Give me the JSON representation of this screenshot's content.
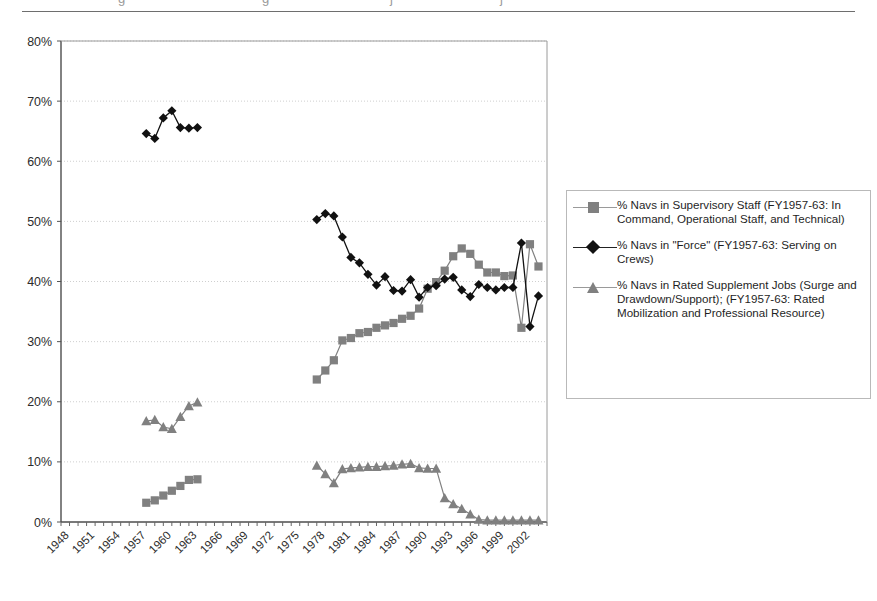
{
  "header": {
    "rule": true,
    "cropped_fragments": [
      "g",
      "g",
      "j",
      "j"
    ]
  },
  "legend": {
    "position": "right",
    "items": [
      {
        "marker": "square",
        "color": "#808080",
        "label": "% Navs in Supervisory Staff (FY1957-63:  In Command, Operational Staff, and Technical)"
      },
      {
        "marker": "diamond",
        "color": "#111111",
        "label": "% Navs in \"Force\" (FY1957-63:  Serving on Crews)"
      },
      {
        "marker": "triangle",
        "color": "#808080",
        "label": "% Navs in Rated Supplement Jobs (Surge and Drawdown/Support); (FY1957-63:  Rated Mobilization and Professional Resource)"
      }
    ]
  },
  "chart_data": {
    "type": "line",
    "title": "",
    "xlabel": "",
    "ylabel": "",
    "ylim": [
      0,
      80
    ],
    "yticks": [
      0,
      10,
      20,
      30,
      40,
      50,
      60,
      70,
      80
    ],
    "ytick_labels": [
      "0%",
      "10%",
      "20%",
      "30%",
      "40%",
      "50%",
      "60%",
      "70%",
      "80%"
    ],
    "xlim": [
      1947,
      2004
    ],
    "xticks": [
      1948,
      1951,
      1954,
      1957,
      1960,
      1963,
      1966,
      1969,
      1972,
      1975,
      1978,
      1981,
      1984,
      1987,
      1990,
      1993,
      1996,
      1999,
      2002
    ],
    "xtick_labels": [
      "1948",
      "1951",
      "1954",
      "1957",
      "1960",
      "1963",
      "1966",
      "1969",
      "1972",
      "1975",
      "1978",
      "1981",
      "1984",
      "1987",
      "1990",
      "1993",
      "1996",
      "1999",
      "2002"
    ],
    "xtick_rotation": 45,
    "minor_xticks_annual": true,
    "grid": "horizontal-dotted",
    "series": [
      {
        "name": "% Navs in Supervisory Staff (FY1957-63:  In Command, Operational Staff, and Technical)",
        "marker": "square",
        "color": "#808080",
        "segments": [
          {
            "x": [
              1957,
              1958,
              1959,
              1960,
              1961,
              1962,
              1963
            ],
            "y": [
              3.2,
              3.6,
              4.4,
              5.2,
              6.0,
              7.0,
              7.1
            ]
          },
          {
            "x": [
              1977,
              1978,
              1979,
              1980,
              1981,
              1982,
              1983,
              1984,
              1985,
              1986,
              1987,
              1988,
              1989,
              1990,
              1991,
              1992,
              1993,
              1994,
              1995,
              1996,
              1997,
              1998,
              1999,
              2000,
              2001,
              2002,
              2003
            ],
            "y": [
              23.7,
              25.2,
              26.9,
              30.2,
              30.6,
              31.4,
              31.6,
              32.3,
              32.7,
              33.1,
              33.8,
              34.3,
              35.5,
              38.8,
              39.9,
              41.8,
              44.2,
              45.5,
              44.6,
              42.8,
              41.5,
              41.5,
              40.9,
              41.0,
              32.3,
              46.2,
              42.5
            ]
          }
        ]
      },
      {
        "name": "% Navs in \"Force\" (FY1957-63:  Serving on Crews)",
        "marker": "diamond",
        "color": "#111111",
        "segments": [
          {
            "x": [
              1957,
              1958,
              1959,
              1960,
              1961,
              1962,
              1963
            ],
            "y": [
              64.6,
              63.8,
              67.2,
              68.4,
              65.6,
              65.5,
              65.6
            ]
          },
          {
            "x": [
              1977,
              1978,
              1979,
              1980,
              1981,
              1982,
              1983,
              1984,
              1985,
              1986,
              1987,
              1988,
              1989,
              1990,
              1991,
              1992,
              1993,
              1994,
              1995,
              1996,
              1997,
              1998,
              1999,
              2000,
              2001,
              2002,
              2003
            ],
            "y": [
              50.3,
              51.3,
              50.9,
              47.4,
              44.0,
              43.1,
              41.2,
              39.4,
              40.8,
              38.5,
              38.4,
              40.3,
              37.4,
              39.0,
              39.3,
              40.4,
              40.7,
              38.6,
              37.5,
              39.5,
              39.0,
              38.6,
              39.0,
              39.0,
              46.4,
              32.5,
              37.6,
              34.0
            ]
          }
        ]
      },
      {
        "name": "% Navs in Rated Supplement Jobs (Surge and Drawdown/Support); (FY1957-63:  Rated Mobilization and Professional Resource)",
        "marker": "triangle",
        "color": "#808080",
        "segments": [
          {
            "x": [
              1957,
              1958,
              1959,
              1960,
              1961,
              1962,
              1963
            ],
            "y": [
              16.8,
              17.0,
              15.8,
              15.5,
              17.5,
              19.3,
              19.9
            ]
          },
          {
            "x": [
              1977,
              1978,
              1979,
              1980,
              1981,
              1982,
              1983,
              1984,
              1985,
              1986,
              1987,
              1988,
              1989,
              1990,
              1991,
              1992,
              1993,
              1994,
              1995,
              1996,
              1997,
              1998,
              1999,
              2000,
              2001,
              2002,
              2003
            ],
            "y": [
              9.4,
              8.0,
              6.5,
              8.8,
              9.0,
              9.1,
              9.2,
              9.2,
              9.3,
              9.4,
              9.6,
              9.7,
              9.0,
              8.9,
              8.9,
              4.0,
              3.0,
              2.2,
              1.3,
              0.4,
              0.3,
              0.3,
              0.3,
              0.3,
              0.3,
              0.3,
              0.3
            ]
          }
        ]
      }
    ]
  }
}
